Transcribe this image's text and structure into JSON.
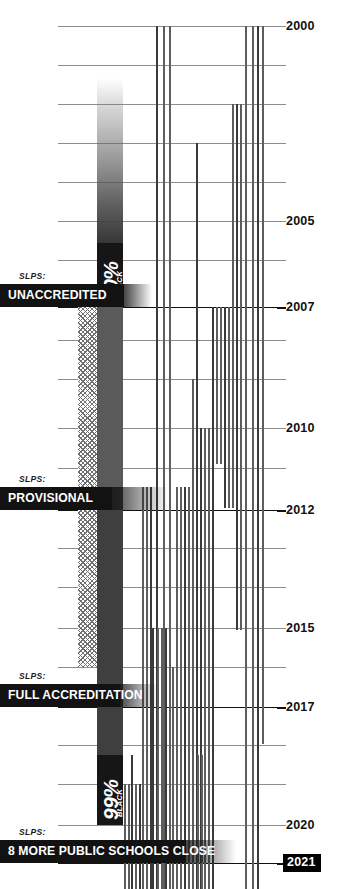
{
  "chart_data": {
    "type": "timeline",
    "xlabel": "",
    "ylabel": "Year",
    "ylim": [
      2000,
      2021
    ],
    "grid": true,
    "legend_position": "none",
    "axis": {
      "years": [
        {
          "year": "2000",
          "labeled": true,
          "major": false,
          "y": 26
        },
        {
          "year": "2001",
          "labeled": false,
          "major": false,
          "y": 65
        },
        {
          "year": "2002",
          "labeled": false,
          "major": false,
          "y": 104
        },
        {
          "year": "2003",
          "labeled": false,
          "major": false,
          "y": 143
        },
        {
          "year": "2004",
          "labeled": false,
          "major": false,
          "y": 182
        },
        {
          "year": "2005",
          "labeled": true,
          "major": false,
          "y": 221
        },
        {
          "year": "2006",
          "labeled": false,
          "major": false,
          "y": 260
        },
        {
          "year": "2007",
          "labeled": true,
          "major": true,
          "y": 307
        },
        {
          "year": "2008",
          "labeled": false,
          "major": false,
          "y": 340
        },
        {
          "year": "2009",
          "labeled": false,
          "major": false,
          "y": 379
        },
        {
          "year": "2010",
          "labeled": true,
          "major": false,
          "y": 428
        },
        {
          "year": "2011",
          "labeled": false,
          "major": false,
          "y": 468
        },
        {
          "year": "2012",
          "labeled": true,
          "major": true,
          "y": 510
        },
        {
          "year": "2013",
          "labeled": false,
          "major": false,
          "y": 548
        },
        {
          "year": "2014",
          "labeled": false,
          "major": false,
          "y": 587
        },
        {
          "year": "2015",
          "labeled": true,
          "major": false,
          "y": 628
        },
        {
          "year": "2016",
          "labeled": false,
          "major": false,
          "y": 667
        },
        {
          "year": "2017",
          "labeled": true,
          "major": true,
          "y": 707
        },
        {
          "year": "2018",
          "labeled": false,
          "major": false,
          "y": 745
        },
        {
          "year": "2019",
          "labeled": false,
          "major": false,
          "y": 784
        },
        {
          "year": "2020",
          "labeled": true,
          "major": false,
          "y": 825
        },
        {
          "year": "2021",
          "labeled": true,
          "major": true,
          "y": 863
        }
      ]
    },
    "status_events": [
      {
        "org": "SLPS:",
        "label": "UNACCREDITED",
        "year": "2007",
        "y": 284,
        "solid_width": 124,
        "fade_width": 152
      },
      {
        "org": "SLPS:",
        "label": "PROVISIONAL",
        "year": "2012",
        "y": 487,
        "solid_width": 112,
        "fade_width": 168
      },
      {
        "org": "SLPS:",
        "label": "FULL ACCREDITATION",
        "year": "2017",
        "y": 684,
        "solid_width": 120,
        "fade_width": 158
      },
      {
        "org": "SLPS:",
        "label": "8 MORE PUBLIC SCHOOLS CLOSE",
        "year": "2021",
        "y": 840,
        "solid_width": 186,
        "fade_width": 236
      }
    ],
    "demographic_markers": [
      {
        "value": "90%",
        "unit": "BLACK",
        "y_top": 243,
        "y_bottom": 307
      },
      {
        "value": "99%",
        "unit": "BLACK",
        "y_top": 755,
        "y_bottom": 825
      }
    ],
    "demographic_column": {
      "note": "share of SLPS students who are Black, rising over time",
      "x": 97,
      "width": 26,
      "segments": [
        {
          "y": 78,
          "h": 165,
          "style": "fade"
        },
        {
          "y": 307,
          "h": 180,
          "style": "solid"
        },
        {
          "y": 487,
          "h": 268,
          "style": "dark"
        }
      ]
    },
    "provisional_column": {
      "note": "hatched band spanning unaccredited-through-provisional period",
      "x": 78,
      "width": 19,
      "y": 307,
      "h": 360
    },
    "school_bars": {
      "note": "each vertical line is one public school; line runs from its start year down to its closing year",
      "items": [
        {
          "x": 156,
          "y0": 26,
          "y1": 889
        },
        {
          "x": 163,
          "y0": 26,
          "y1": 889
        },
        {
          "x": 169,
          "y0": 26,
          "y1": 889
        },
        {
          "x": 196,
          "y0": 143,
          "y1": 889
        },
        {
          "x": 245,
          "y0": 26,
          "y1": 889
        },
        {
          "x": 252,
          "y0": 26,
          "y1": 889
        },
        {
          "x": 257,
          "y0": 26,
          "y1": 889
        },
        {
          "x": 262,
          "y0": 26,
          "y1": 744
        },
        {
          "x": 240,
          "y0": 104,
          "y1": 630
        },
        {
          "x": 236,
          "y0": 104,
          "y1": 630
        },
        {
          "x": 232,
          "y0": 104,
          "y1": 508
        },
        {
          "x": 228,
          "y0": 307,
          "y1": 508
        },
        {
          "x": 224,
          "y0": 307,
          "y1": 508
        },
        {
          "x": 220,
          "y0": 307,
          "y1": 464
        },
        {
          "x": 216,
          "y0": 307,
          "y1": 464
        },
        {
          "x": 212,
          "y0": 307,
          "y1": 889
        },
        {
          "x": 208,
          "y0": 428,
          "y1": 889
        },
        {
          "x": 204,
          "y0": 428,
          "y1": 889
        },
        {
          "x": 200,
          "y0": 428,
          "y1": 889
        },
        {
          "x": 192,
          "y0": 379,
          "y1": 889
        },
        {
          "x": 188,
          "y0": 487,
          "y1": 889
        },
        {
          "x": 184,
          "y0": 487,
          "y1": 889
        },
        {
          "x": 180,
          "y0": 487,
          "y1": 889
        },
        {
          "x": 176,
          "y0": 487,
          "y1": 889
        },
        {
          "x": 150,
          "y0": 487,
          "y1": 889
        },
        {
          "x": 146,
          "y0": 487,
          "y1": 889
        },
        {
          "x": 142,
          "y0": 487,
          "y1": 889
        },
        {
          "x": 152,
          "y0": 628,
          "y1": 889
        },
        {
          "x": 157,
          "y0": 628,
          "y1": 889
        },
        {
          "x": 161,
          "y0": 628,
          "y1": 889
        },
        {
          "x": 165,
          "y0": 628,
          "y1": 889
        },
        {
          "x": 172,
          "y0": 667,
          "y1": 889
        },
        {
          "x": 135,
          "y0": 784,
          "y1": 889
        },
        {
          "x": 139,
          "y0": 784,
          "y1": 889
        },
        {
          "x": 128,
          "y0": 784,
          "y1": 889
        },
        {
          "x": 124,
          "y0": 784,
          "y1": 889
        },
        {
          "x": 131,
          "y0": 755,
          "y1": 889
        },
        {
          "x": 197,
          "y0": 755,
          "y1": 889
        },
        {
          "x": 201,
          "y0": 755,
          "y1": 889
        }
      ]
    }
  }
}
